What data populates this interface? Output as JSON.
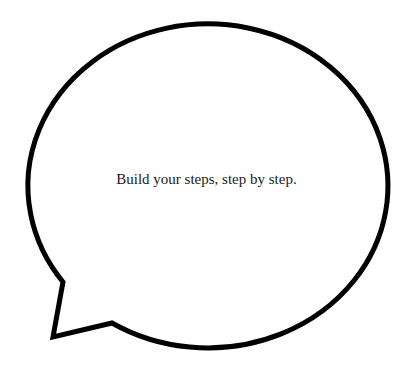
{
  "speech_bubble": {
    "text": "Build your steps, step by step.",
    "stroke_color": "#000000",
    "fill_color": "#ffffff",
    "text_color": "#1a1a1a"
  }
}
